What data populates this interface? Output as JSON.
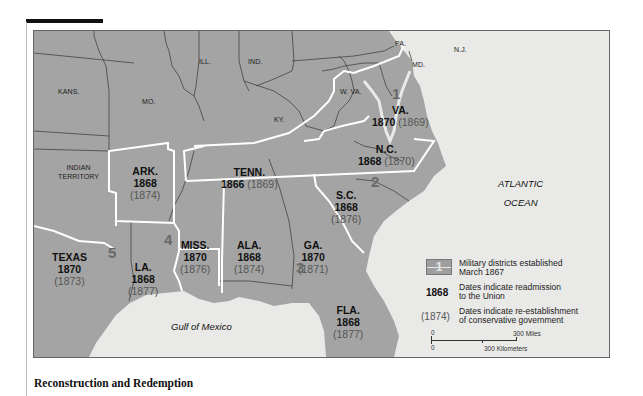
{
  "caption": "Reconstruction and Redemption",
  "map": {
    "ocean_labels": {
      "atlantic_line1": "ATLANTIC",
      "atlantic_line2": "OCEAN",
      "gulf": "Gulf of Mexico"
    },
    "non_confederate_states": {
      "kans": "KANS.",
      "mo": "MO.",
      "ill": "ILL.",
      "ind": "IND.",
      "ky": "KY.",
      "wva": "W. VA.",
      "pa": "PA.",
      "md": "MD.",
      "nj": "N.J.",
      "indian_territory_line1": "INDIAN",
      "indian_territory_line2": "TERRITORY"
    },
    "states": [
      {
        "name": "VA.",
        "readmission": "1870",
        "conservative": "(1869)"
      },
      {
        "name": "N.C.",
        "readmission": "1868",
        "conservative": "(1870)"
      },
      {
        "name": "TENN.",
        "readmission": "1866",
        "conservative": "(1869)"
      },
      {
        "name": "ARK.",
        "readmission": "1868",
        "conservative": "(1874)"
      },
      {
        "name": "S.C.",
        "readmission": "1868",
        "conservative": "(1876)"
      },
      {
        "name": "MISS.",
        "readmission": "1870",
        "conservative": "(1876)"
      },
      {
        "name": "ALA.",
        "readmission": "1868",
        "conservative": "(1874)"
      },
      {
        "name": "GA.",
        "readmission": "1870",
        "conservative": "(1871)"
      },
      {
        "name": "TEXAS",
        "readmission": "1870",
        "conservative": "(1873)"
      },
      {
        "name": "LA.",
        "readmission": "1868",
        "conservative": "(1877)"
      },
      {
        "name": "FLA.",
        "readmission": "1868",
        "conservative": "(1877)"
      }
    ],
    "military_districts": [
      "1",
      "2",
      "3",
      "4",
      "5"
    ]
  },
  "legend": {
    "swatch_number": "1",
    "districts_line1": "Military districts established",
    "districts_line2": "March 1867",
    "readmission_sample": "1868",
    "readmission_line1": "Dates indicate readmission",
    "readmission_line2": "to the Union",
    "conservative_sample": "(1874)",
    "conservative_line1": "Dates indicate re-establishment",
    "conservative_line2": "of conservative government",
    "scale": {
      "zero_top": "0",
      "miles": "300 Miles",
      "zero_bottom": "0",
      "km": "300 Kilometers"
    }
  },
  "colors": {
    "land": "#a4a4a4",
    "water": "#e9e9e7",
    "district_border": "#ffffff",
    "state_border": "#444444"
  }
}
